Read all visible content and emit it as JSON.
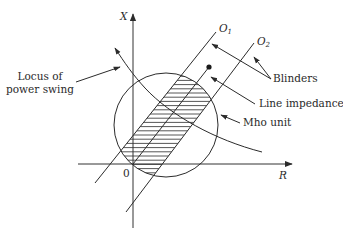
{
  "figure": {
    "type": "impedance-plane diagram",
    "axes": {
      "vertical_label": "X",
      "horizontal_label": "R",
      "origin_label": "0"
    },
    "blinders": [
      {
        "label": "O",
        "subscript": "1"
      },
      {
        "label": "O",
        "subscript": "2"
      }
    ],
    "annotations": {
      "locus": [
        "Locus of",
        "power swing"
      ],
      "blinders": "Blinders",
      "line_impedance": "Line impedance",
      "mho_unit": "Mho unit"
    },
    "colors": {
      "line": "#2b2b2b",
      "background": "#ffffff"
    }
  }
}
